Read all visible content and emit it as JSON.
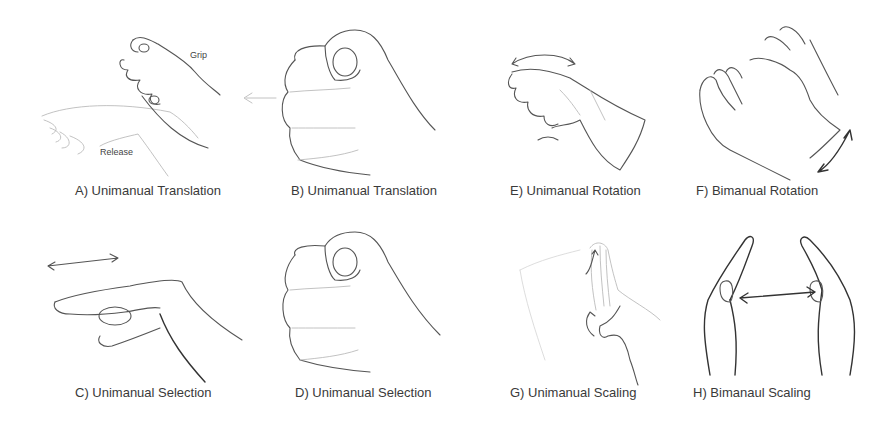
{
  "figure": {
    "panels": [
      {
        "id": "A",
        "caption": "A) Unimanual Translation",
        "labels": {
          "grip": "Grip",
          "release": "Release"
        },
        "icon": "grip-release-hand"
      },
      {
        "id": "B",
        "caption": "B) Unimanual Translation",
        "icon": "fist-with-arrow"
      },
      {
        "id": "C",
        "caption": "C) Unimanual Selection",
        "icon": "pointing-hand-with-double-arrow"
      },
      {
        "id": "D",
        "caption": "D) Unimanual Selection",
        "icon": "fist"
      },
      {
        "id": "E",
        "caption": "E) Unimanual Rotation",
        "icon": "rotating-hand"
      },
      {
        "id": "F",
        "caption": "F) Bimanual Rotation",
        "icon": "two-hands-rotation"
      },
      {
        "id": "G",
        "caption": "G) Unimanual Scaling",
        "icon": "scaling-hand"
      },
      {
        "id": "H",
        "caption": "H) Bimanaul Scaling",
        "icon": "two-hands-scaling"
      }
    ]
  }
}
